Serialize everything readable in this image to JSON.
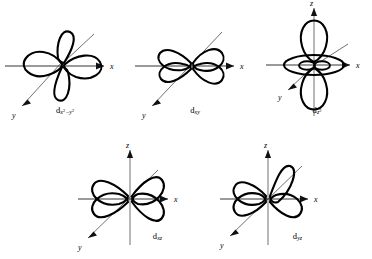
{
  "figure": {
    "background_color": "#ffffff",
    "line_color": "#000000",
    "width": 372,
    "height": 259
  },
  "axes": {
    "x_label": "x",
    "y_label": "y",
    "z_label": "z"
  },
  "orbitals": [
    {
      "id": "dx2-y2",
      "label_base": "d",
      "label_sub_main": "x",
      "label_sub_sup1": "2",
      "label_sub_mid": "−y",
      "label_sub_sup2": "2",
      "label_plain": "dx2−y2",
      "lobe_count": 4,
      "lobe_orientation": "along x and y axes",
      "axes_shown": [
        "x",
        "y"
      ],
      "row": 1,
      "column": 1
    },
    {
      "id": "dxy",
      "label_base": "d",
      "label_sub_main": "xy",
      "label_sub_sup1": "",
      "label_sub_mid": "",
      "label_sub_sup2": "",
      "label_plain": "dxy",
      "lobe_count": 4,
      "lobe_orientation": "between x and y axes",
      "axes_shown": [
        "x",
        "y"
      ],
      "row": 1,
      "column": 2
    },
    {
      "id": "dz2",
      "label_base": "d",
      "label_sub_main": "z",
      "label_sub_sup1": "2",
      "label_sub_mid": "",
      "label_sub_sup2": "",
      "label_plain": "dz2",
      "lobe_count": 2,
      "lobe_orientation": "along z axis with equatorial torus",
      "axes_shown": [
        "x",
        "y",
        "z"
      ],
      "row": 1,
      "column": 3
    },
    {
      "id": "dxz",
      "label_base": "d",
      "label_sub_main": "xz",
      "label_sub_sup1": "",
      "label_sub_mid": "",
      "label_sub_sup2": "",
      "label_plain": "dxz",
      "lobe_count": 4,
      "lobe_orientation": "between x and z axes",
      "axes_shown": [
        "x",
        "y",
        "z"
      ],
      "row": 2,
      "column": 1
    },
    {
      "id": "dyz",
      "label_base": "d",
      "label_sub_main": "yz",
      "label_sub_sup1": "",
      "label_sub_mid": "",
      "label_sub_sup2": "",
      "label_plain": "dyz",
      "lobe_count": 4,
      "lobe_orientation": "between y and z axes",
      "axes_shown": [
        "x",
        "y",
        "z"
      ],
      "row": 2,
      "column": 2
    }
  ]
}
